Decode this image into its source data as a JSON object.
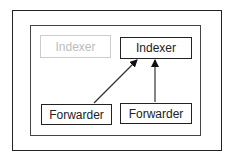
{
  "diagram": {
    "nodes": [
      {
        "id": "indexer-inactive",
        "label": "Indexer",
        "state": "inactive"
      },
      {
        "id": "indexer-active",
        "label": "Indexer",
        "state": "active"
      },
      {
        "id": "forwarder-1",
        "label": "Forwarder"
      },
      {
        "id": "forwarder-2",
        "label": "Forwarder"
      }
    ],
    "edges": [
      {
        "from": "forwarder-1",
        "to": "indexer-active"
      },
      {
        "from": "forwarder-2",
        "to": "indexer-active"
      }
    ],
    "colors": {
      "stroke": "#222222",
      "inactive": "#cccccc"
    }
  }
}
